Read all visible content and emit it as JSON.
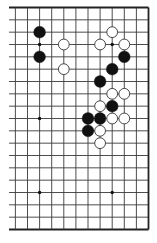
{
  "diagram": {
    "type": "go-board-section",
    "board_size": 19,
    "visible_columns": [
      7,
      18
    ],
    "visible_rows": [
      0,
      18
    ],
    "edges_with_border": [
      "top",
      "right",
      "bottom"
    ],
    "open_edges": [
      "left"
    ],
    "colors": {
      "background": "#ffffff",
      "grid_line": "#3a3a3a",
      "border_line": "#222222",
      "black_stone": "#111111",
      "white_stone_fill": "#ffffff",
      "white_stone_stroke": "#333333",
      "star_point": "#111111"
    },
    "star_points": [
      {
        "col": 9,
        "row": 3
      },
      {
        "col": 15,
        "row": 3
      },
      {
        "col": 9,
        "row": 9
      },
      {
        "col": 15,
        "row": 9
      },
      {
        "col": 9,
        "row": 15
      },
      {
        "col": 15,
        "row": 15
      }
    ],
    "stones": [
      {
        "color": "black",
        "col": 9,
        "row": 2
      },
      {
        "color": "black",
        "col": 9,
        "row": 4
      },
      {
        "color": "white",
        "col": 11,
        "row": 3
      },
      {
        "color": "white",
        "col": 11,
        "row": 5
      },
      {
        "color": "white",
        "col": 15,
        "row": 2
      },
      {
        "color": "white",
        "col": 14,
        "row": 3
      },
      {
        "color": "white",
        "col": 16,
        "row": 3
      },
      {
        "color": "black",
        "col": 16,
        "row": 4
      },
      {
        "color": "black",
        "col": 15,
        "row": 5
      },
      {
        "color": "black",
        "col": 14,
        "row": 6
      },
      {
        "color": "white",
        "col": 15,
        "row": 7
      },
      {
        "color": "white",
        "col": 16,
        "row": 7
      },
      {
        "color": "white",
        "col": 14,
        "row": 8
      },
      {
        "color": "black",
        "col": 15,
        "row": 8
      },
      {
        "color": "black",
        "col": 13,
        "row": 9
      },
      {
        "color": "black",
        "col": 14,
        "row": 9
      },
      {
        "color": "white",
        "col": 15,
        "row": 9
      },
      {
        "color": "white",
        "col": 16,
        "row": 9
      },
      {
        "color": "black",
        "col": 13,
        "row": 10
      },
      {
        "color": "white",
        "col": 14,
        "row": 10
      },
      {
        "color": "white",
        "col": 14,
        "row": 11
      }
    ]
  }
}
